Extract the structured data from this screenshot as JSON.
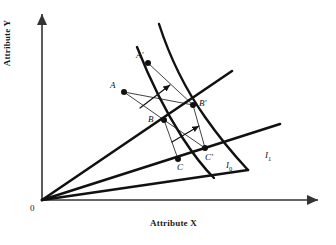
{
  "figure": {
    "kind": "indifference-curve-diagram",
    "background_color": "#ffffff",
    "line_color": "#111111",
    "axis_color": "#333333"
  },
  "axes": {
    "x_label": "Attribute X",
    "y_label": "Attribute Y",
    "origin_label": "0",
    "x_axis": {
      "x1": 42,
      "y1": 200,
      "x2": 318,
      "y2": 200
    },
    "y_axis": {
      "x1": 42,
      "y1": 200,
      "x2": 42,
      "y2": 14
    }
  },
  "points": [
    {
      "id": "A",
      "label": "A",
      "x": 124,
      "y": 92,
      "label_x": 110,
      "label_y": 80
    },
    {
      "id": "Ap",
      "label": "A'",
      "x": 148,
      "y": 63,
      "label_x": 136,
      "label_y": 50
    },
    {
      "id": "B",
      "label": "B",
      "x": 164,
      "y": 120,
      "label_x": 148,
      "label_y": 114
    },
    {
      "id": "Bp",
      "label": "B'",
      "x": 193,
      "y": 105,
      "label_x": 199,
      "label_y": 98
    },
    {
      "id": "C",
      "label": "C",
      "x": 178,
      "y": 159,
      "label_x": 177,
      "label_y": 162
    },
    {
      "id": "Cp",
      "label": "C'",
      "x": 205,
      "y": 148,
      "label_x": 205,
      "label_y": 152
    }
  ],
  "curves": [
    {
      "id": "I0",
      "label": "I",
      "sub": "0",
      "label_x": 226,
      "label_y": 160,
      "path": "M 137 47 C 150 80, 166 112, 182 137 C 193 154, 204 168, 214 178"
    },
    {
      "id": "I1",
      "label": "I",
      "sub": "1",
      "label_x": 265,
      "label_y": 150,
      "path": "M 159 24 C 170 58, 186 90, 205 117 C 219 137, 234 155, 248 170"
    }
  ],
  "rays": [
    {
      "id": "ray-upper",
      "x1": 42,
      "y1": 200,
      "x2": 232,
      "y2": 71
    },
    {
      "id": "ray-middle",
      "x1": 42,
      "y1": 200,
      "x2": 280,
      "y2": 124
    },
    {
      "id": "ray-lower",
      "x1": 42,
      "y1": 200,
      "x2": 248,
      "y2": 170
    }
  ],
  "connectors": [
    {
      "id": "A-to-Bp",
      "x1": 124,
      "y1": 92,
      "x2": 193,
      "y2": 105
    },
    {
      "id": "A-to-B",
      "x1": 124,
      "y1": 92,
      "x2": 164,
      "y2": 120
    },
    {
      "id": "Ap-to-Bp",
      "x1": 148,
      "y1": 63,
      "x2": 193,
      "y2": 105
    },
    {
      "id": "B-to-C",
      "x1": 164,
      "y1": 120,
      "x2": 178,
      "y2": 159
    },
    {
      "id": "B-to-Cp",
      "x1": 164,
      "y1": 120,
      "x2": 205,
      "y2": 148
    },
    {
      "id": "Bp-to-Cp",
      "x1": 193,
      "y1": 105,
      "x2": 205,
      "y2": 148
    }
  ],
  "arrows": [
    {
      "id": "arrow-upper",
      "x1": 140,
      "y1": 108,
      "x2": 170,
      "y2": 85
    },
    {
      "id": "arrow-lower",
      "x1": 172,
      "y1": 142,
      "x2": 199,
      "y2": 126
    }
  ]
}
